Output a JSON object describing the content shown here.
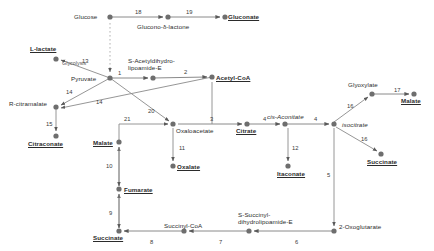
{
  "diagram": {
    "style": {
      "node_color": "#6e6e6e",
      "edge_color": "#7a7a7a",
      "text_color": "#2b2b2b",
      "background": "#ffffff"
    },
    "annotation": {
      "glycolysis_label": "Glycolysis"
    },
    "metabolites": [
      {
        "id": "glucose",
        "name": "Glucose",
        "x": 110,
        "y": 17,
        "label_x": 74,
        "label_y": 13,
        "bold": false
      },
      {
        "id": "glucono_lactone",
        "name": "Glucono-δ-lactone",
        "x": 168,
        "y": 17,
        "label_x": 137,
        "label_y": 23,
        "bold": false
      },
      {
        "id": "gluconate",
        "name": "Gluconate",
        "x": 225,
        "y": 17,
        "label_x": 228,
        "label_y": 13,
        "bold": true
      },
      {
        "id": "l_lactate",
        "name": "L-lactate",
        "x": 56,
        "y": 59,
        "label_x": 30,
        "label_y": 45,
        "bold": true
      },
      {
        "id": "pyruvate",
        "name": "Pyruvate",
        "x": 110,
        "y": 78,
        "label_x": 71,
        "label_y": 75,
        "bold": false
      },
      {
        "id": "s_acetyl",
        "name": "S-Acetyldihydro-\nlipoamide-E",
        "x": 153,
        "y": 78,
        "label_x": 128,
        "label_y": 57,
        "bold": false
      },
      {
        "id": "acetyl_coa",
        "name": "Acetyl-CoA",
        "x": 212,
        "y": 77,
        "label_x": 216,
        "label_y": 74,
        "bold": true
      },
      {
        "id": "r_citramalate",
        "name": "R-citramalate",
        "x": 56,
        "y": 107,
        "label_x": 9,
        "label_y": 100,
        "bold": false
      },
      {
        "id": "citraconate",
        "name": "Citraconate",
        "x": 56,
        "y": 136,
        "label_x": 28,
        "label_y": 140,
        "bold": true
      },
      {
        "id": "oxaloacetate",
        "name": "Oxaloacetate",
        "x": 173,
        "y": 124,
        "label_x": 176,
        "label_y": 127,
        "bold": false
      },
      {
        "id": "malate_left",
        "name": "Malate",
        "x": 119,
        "y": 142,
        "label_x": 93,
        "label_y": 139,
        "bold": true
      },
      {
        "id": "oxalate",
        "name": "Oxalate",
        "x": 173,
        "y": 166,
        "label_x": 177,
        "label_y": 163,
        "bold": true
      },
      {
        "id": "fumarate",
        "name": "Fumarate",
        "x": 119,
        "y": 189,
        "label_x": 124,
        "label_y": 186,
        "bold": true
      },
      {
        "id": "succinate_bl",
        "name": "Succinate",
        "x": 119,
        "y": 231,
        "label_x": 93,
        "label_y": 234,
        "bold": true
      },
      {
        "id": "succinyl_coa",
        "name": "Succinyl-CoA",
        "x": 184,
        "y": 231,
        "label_x": 164,
        "label_y": 222,
        "bold": false
      },
      {
        "id": "s_succinyl",
        "name": "S-Succinyl-\ndihydrolipoamide-E",
        "x": 249,
        "y": 231,
        "label_x": 238,
        "label_y": 211,
        "bold": false
      },
      {
        "id": "oxoglutarate",
        "name": "2-Oxoglutarate",
        "x": 334,
        "y": 231,
        "label_x": 339,
        "label_y": 223,
        "bold": false
      },
      {
        "id": "citrate",
        "name": "Citrate",
        "x": 247,
        "y": 124,
        "label_x": 236,
        "label_y": 127,
        "bold": true
      },
      {
        "id": "cis_aconitate",
        "name": "cis-Aconitate",
        "x": 285,
        "y": 124,
        "label_x": 267,
        "label_y": 113,
        "bold": false
      },
      {
        "id": "itaconate",
        "name": "Itaconate",
        "x": 288,
        "y": 166,
        "label_x": 277,
        "label_y": 170,
        "bold": true
      },
      {
        "id": "isocitrate",
        "name": "isocitrate",
        "x": 334,
        "y": 124,
        "label_x": 342,
        "label_y": 121,
        "bold": false
      },
      {
        "id": "glyoxylate",
        "name": "Glyoxylate",
        "x": 372,
        "y": 94,
        "label_x": 348,
        "label_y": 81,
        "bold": false
      },
      {
        "id": "malate_right",
        "name": "Malate",
        "x": 414,
        "y": 94,
        "label_x": 401,
        "label_y": 97,
        "bold": true
      },
      {
        "id": "succinate_r",
        "name": "Succinate",
        "x": 381,
        "y": 154,
        "label_x": 367,
        "label_y": 158,
        "bold": true
      }
    ],
    "reactions": [
      {
        "num": "18",
        "from": "glucose",
        "to": "glucono_lactone",
        "label_x": 135,
        "label_y": 9
      },
      {
        "num": "19",
        "from": "glucono_lactone",
        "to": "gluconate",
        "label_x": 186,
        "label_y": 9
      },
      {
        "num": "13",
        "from": "pyruvate",
        "to": "l_lactate",
        "label_x": 82,
        "label_y": 58
      },
      {
        "num": "1",
        "from": "pyruvate",
        "to": "s_acetyl",
        "label_x": 118,
        "label_y": 70
      },
      {
        "num": "2",
        "from": "s_acetyl",
        "to": "acetyl_coa",
        "label_x": 184,
        "label_y": 69
      },
      {
        "num": "14",
        "from": "pyruvate",
        "to": "r_citramalate",
        "label_x": 66,
        "label_y": 89
      },
      {
        "num": "14",
        "from": "acetyl_coa",
        "to": "r_citramalate",
        "label_x": 96,
        "label_y": 99
      },
      {
        "num": "15",
        "from": "r_citramalate",
        "to": "citraconate",
        "label_x": 46,
        "label_y": 121
      },
      {
        "num": "20",
        "from": "pyruvate",
        "to": "oxaloacetate",
        "label_x": 148,
        "label_y": 108
      },
      {
        "num": "21",
        "from": "malate_left",
        "to": "oxaloacetate",
        "label_x": 124,
        "label_y": 116
      },
      {
        "num": "11",
        "from": "oxaloacetate",
        "to": "oxalate",
        "label_x": 179,
        "label_y": 145
      },
      {
        "num": "3",
        "from": "oxaloacetate",
        "to": "citrate",
        "label_x": 210,
        "label_y": 116
      },
      {
        "num": "4",
        "from": "citrate",
        "to": "cis_aconitate",
        "label_x": 263,
        "label_y": 116
      },
      {
        "num": "4",
        "from": "cis_aconitate",
        "to": "isocitrate",
        "label_x": 314,
        "label_y": 116
      },
      {
        "num": "12",
        "from": "cis_aconitate",
        "to": "itaconate",
        "label_x": 292,
        "label_y": 145
      },
      {
        "num": "16",
        "from": "isocitrate",
        "to": "glyoxylate",
        "label_x": 347,
        "label_y": 103
      },
      {
        "num": "16",
        "from": "isocitrate",
        "to": "succinate_r",
        "label_x": 361,
        "label_y": 136
      },
      {
        "num": "17",
        "from": "glyoxylate",
        "to": "malate_right",
        "label_x": 394,
        "label_y": 87
      },
      {
        "num": "5",
        "from": "isocitrate",
        "to": "oxoglutarate",
        "label_x": 327,
        "label_y": 172
      },
      {
        "num": "6",
        "from": "oxoglutarate",
        "to": "s_succinyl",
        "label_x": 295,
        "label_y": 239
      },
      {
        "num": "7",
        "from": "s_succinyl",
        "to": "succinyl_coa",
        "label_x": 219,
        "label_y": 239
      },
      {
        "num": "8",
        "from": "succinyl_coa",
        "to": "succinate_bl",
        "label_x": 150,
        "label_y": 239
      },
      {
        "num": "9",
        "from": "succinate_bl",
        "to": "fumarate",
        "label_x": 109,
        "label_y": 210
      },
      {
        "num": "10",
        "from": "fumarate",
        "to": "malate_left",
        "label_x": 106,
        "label_y": 163
      }
    ]
  }
}
